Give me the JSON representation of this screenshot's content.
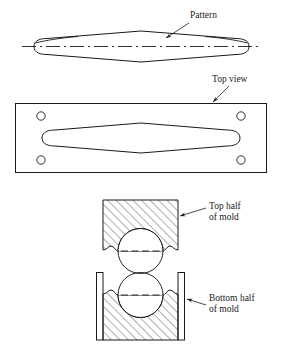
{
  "figure": {
    "background_color": "#ffffff",
    "line_color": "#1a1a1a",
    "hatch_color": "#3a3a3a",
    "text_color": "#1a1a1a"
  },
  "labels": {
    "pattern": "Pattern",
    "top_view": "Top view",
    "top_half_line1": "Top half",
    "top_half_line2": "of mold",
    "bottom_half_line1": "Bottom half",
    "bottom_half_line2": "of mold"
  },
  "views": {
    "pattern_side": {
      "name": "Pattern side view",
      "shape": "lens-diamond with rounded ends",
      "centerline": "dash-dot horizontal"
    },
    "top_view": {
      "name": "Top view plate",
      "pin_hole_count": 4,
      "cavity_shape": "lens-diamond with rounded ends"
    },
    "top_half_mold": {
      "name": "Top half of mold",
      "hatched": true,
      "hatch_angle_deg": 45,
      "cavity": "circular"
    },
    "bottom_half_mold": {
      "name": "Bottom half of mold",
      "hatched": true,
      "hatch_angle_deg": 45,
      "cavity": "circular",
      "flask_walls": 2
    }
  }
}
